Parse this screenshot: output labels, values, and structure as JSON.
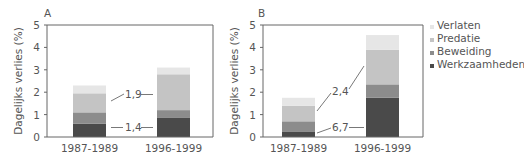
{
  "chart_data": [
    {
      "type": "bar",
      "stacked": true,
      "panel_label": "A",
      "ylabel": "Dagelijks verlies (%)",
      "xlabel": "",
      "ylim": [
        0,
        5
      ],
      "yticks": [
        "0",
        "1",
        "2",
        "3",
        "4",
        "5"
      ],
      "categories": [
        "1987-1989",
        "1996-1999"
      ],
      "series": [
        {
          "name": "Werkzaamheden",
          "values": [
            0.6,
            0.85
          ]
        },
        {
          "name": "Beweiding",
          "values": [
            0.5,
            0.35
          ]
        },
        {
          "name": "Predatie",
          "values": [
            0.85,
            1.6
          ]
        },
        {
          "name": "Verlaten",
          "values": [
            0.35,
            0.3
          ]
        }
      ],
      "annotations": [
        {
          "text": "1,9",
          "refers_to": "Predatie",
          "style": "connector"
        },
        {
          "text": "1,4",
          "refers_to": "Werkzaamheden",
          "style": "connector"
        }
      ],
      "grid": false
    },
    {
      "type": "bar",
      "stacked": true,
      "panel_label": "B",
      "ylabel": "Dagelijks verlies (%)",
      "xlabel": "",
      "ylim": [
        0,
        5
      ],
      "yticks": [
        "0",
        "1",
        "2",
        "3",
        "4",
        "5"
      ],
      "categories": [
        "1987-1989",
        "1996-1999"
      ],
      "series": [
        {
          "name": "Werkzaamheden",
          "values": [
            0.25,
            1.75
          ]
        },
        {
          "name": "Beweiding",
          "values": [
            0.45,
            0.6
          ]
        },
        {
          "name": "Predatie",
          "values": [
            0.7,
            1.55
          ]
        },
        {
          "name": "Verlaten",
          "values": [
            0.35,
            0.65
          ]
        }
      ],
      "annotations": [
        {
          "text": "2,4",
          "refers_to": "Predatie",
          "style": "connector"
        },
        {
          "text": "6,7",
          "refers_to": "Werkzaamheden",
          "style": "connector"
        }
      ],
      "grid": false
    }
  ],
  "legend": {
    "placement": "right",
    "items": [
      {
        "name": "Verlaten",
        "color": "#e6e6e6"
      },
      {
        "name": "Predatie",
        "color": "#c4c4c4"
      },
      {
        "name": "Beweiding",
        "color": "#8c8c8c"
      },
      {
        "name": "Werkzaamheden",
        "color": "#4a4a4a"
      }
    ]
  },
  "colors": {
    "Werkzaamheden": "#4a4a4a",
    "Beweiding": "#8c8c8c",
    "Predatie": "#c4c4c4",
    "Verlaten": "#e6e6e6",
    "axis": "#666666",
    "text": "#555555"
  }
}
